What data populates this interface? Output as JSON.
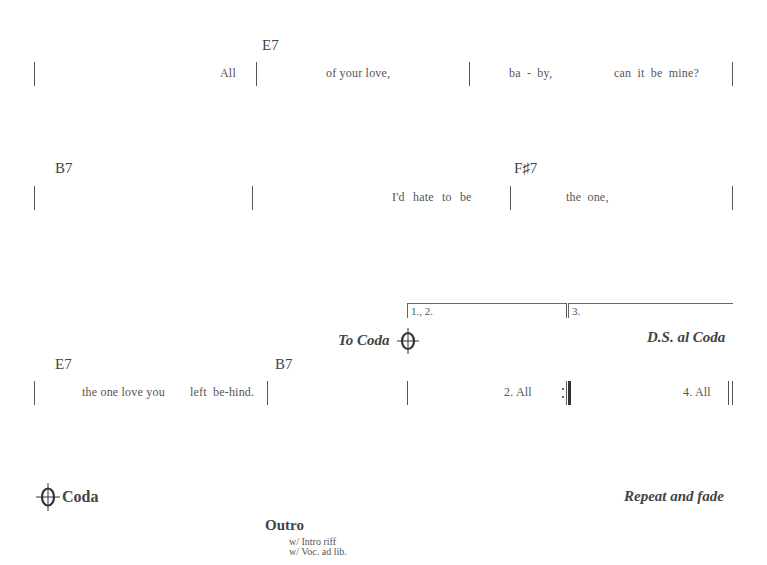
{
  "systems": [
    {
      "chords": [
        {
          "label": "E7",
          "x": 262
        }
      ],
      "lyrics": [
        {
          "text": "All",
          "x": 220
        },
        {
          "text": "of your love,",
          "x": 326
        },
        {
          "text": "ba  -  by,",
          "x": 509
        },
        {
          "text": "can  it  be  mine?",
          "x": 614
        }
      ]
    },
    {
      "chords": [
        {
          "label": "B7",
          "x": 55
        },
        {
          "label": "F♯7",
          "x": 514
        }
      ],
      "lyrics": [
        {
          "text": "I'd  hate  to  be",
          "x": 392
        },
        {
          "text": "the  one,",
          "x": 566
        }
      ]
    },
    {
      "chords": [
        {
          "label": "E7",
          "x": 55
        },
        {
          "label": "B7",
          "x": 275
        }
      ],
      "lyrics": [
        {
          "text": "the one  love you",
          "x": 82
        },
        {
          "text": "left  be-hind.",
          "x": 190
        },
        {
          "text": "2. All",
          "x": 504
        },
        {
          "text": "4. All",
          "x": 683
        }
      ],
      "endings": [
        {
          "label": "1., 2."
        },
        {
          "label": "3."
        }
      ],
      "to_coda": "To Coda",
      "ds_al_coda": "D.S. al Coda"
    }
  ],
  "coda": {
    "label": "Coda",
    "repeat_text": "Repeat and fade",
    "section_title": "Outro",
    "notes": [
      "w/ Intro riff",
      "w/ Voc. ad lib."
    ]
  }
}
